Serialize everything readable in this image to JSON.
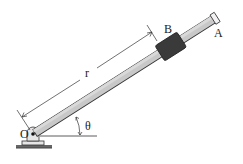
{
  "diagram": {
    "type": "mechanism",
    "labels": {
      "pivot": "O",
      "collar": "B",
      "end": "A",
      "radius": "r",
      "angle": "θ"
    },
    "colors": {
      "bar_fill": "#c8c8c8",
      "bar_stroke": "#333333",
      "collar_fill": "#3a3a3a",
      "line": "#333333",
      "ground": "#555555"
    }
  }
}
